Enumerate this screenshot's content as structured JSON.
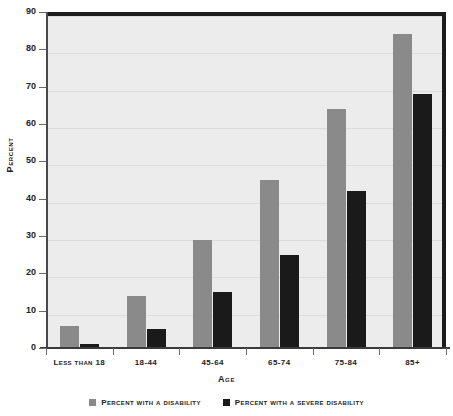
{
  "chart_data": {
    "type": "bar",
    "title": "",
    "xlabel": "Age",
    "ylabel": "Percent",
    "ylim": [
      0,
      90
    ],
    "yticks": [
      0,
      10,
      20,
      30,
      40,
      50,
      60,
      70,
      80,
      90
    ],
    "grid": true,
    "legend_position": "bottom",
    "categories": [
      "Less than 18",
      "18-44",
      "45-64",
      "65-74",
      "75-84",
      "85+"
    ],
    "series": [
      {
        "name": "Percent with a disability",
        "color": "#8a8a8a",
        "values": [
          6,
          14,
          29,
          45,
          64,
          84
        ]
      },
      {
        "name": "Percent with a severe disability",
        "color": "#1a1a1a",
        "values": [
          1,
          5,
          15,
          25,
          42,
          68
        ]
      }
    ]
  },
  "colors": {
    "plot_background": "#ececec",
    "gridline": "#dcdcdc",
    "border": "#1c1c1c",
    "text": "#222222"
  }
}
